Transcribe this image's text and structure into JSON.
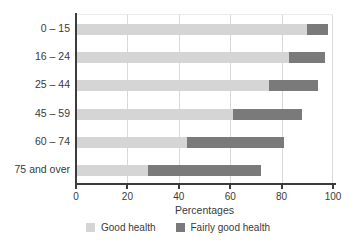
{
  "chart_data": {
    "type": "bar",
    "orientation": "horizontal",
    "stacked": true,
    "categories": [
      "0 – 15",
      "16 – 24",
      "25 – 44",
      "45 – 59",
      "60 – 74",
      "75 and over"
    ],
    "series": [
      {
        "name": "Good health",
        "color": "#d5d5d5",
        "values": [
          90,
          83,
          75,
          61,
          43,
          28
        ]
      },
      {
        "name": "Fairly good health",
        "color": "#7a7a7a",
        "values": [
          8,
          14,
          19,
          27,
          38,
          44
        ]
      }
    ],
    "xlabel": "Percentages",
    "xticks": [
      0,
      20,
      40,
      60,
      80,
      100
    ],
    "xlim": [
      0,
      100
    ],
    "grid": true,
    "legend_position": "bottom",
    "colors": {
      "gridline": "#d9d9d9",
      "axis": "#3c3c3c",
      "text": "#3a3a3a"
    }
  }
}
